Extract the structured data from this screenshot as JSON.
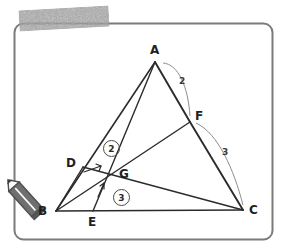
{
  "figure": {
    "kind": "geometry-diagram",
    "frame": {
      "stroke": "#7b7b7b",
      "corner_radius": 9
    },
    "ink_color": "#2b2b2b",
    "light_ink_color": "#8d8d8d"
  },
  "vertices": [
    {
      "id": "A",
      "label": "A",
      "x": 155,
      "y": 62,
      "label_x": 150,
      "label_y": 44
    },
    {
      "id": "B",
      "label": "B",
      "x": 56,
      "y": 211,
      "label_x": 38,
      "label_y": 205
    },
    {
      "id": "C",
      "label": "C",
      "x": 243,
      "y": 210,
      "label_x": 249,
      "label_y": 204
    },
    {
      "id": "D",
      "label": "D",
      "x": 83,
      "y": 167,
      "label_x": 66,
      "label_y": 157
    },
    {
      "id": "E",
      "label": "E",
      "x": 93,
      "y": 211,
      "label_x": 88,
      "label_y": 216
    },
    {
      "id": "F",
      "label": "F",
      "x": 190,
      "y": 122,
      "label_x": 195,
      "label_y": 110
    },
    {
      "id": "G",
      "label": "G",
      "x": 110,
      "y": 175,
      "label_x": 119,
      "label_y": 168
    }
  ],
  "segments": [
    {
      "name": "side-AB",
      "from": "A",
      "to": "B",
      "weight": 1.6,
      "shade": "dark"
    },
    {
      "name": "side-BC",
      "from": "B",
      "to": "C",
      "weight": 1.6,
      "shade": "dark"
    },
    {
      "name": "side-AC-upper",
      "from": "A",
      "to": "F",
      "weight": 1.9,
      "shade": "dark"
    },
    {
      "name": "side-FC-lower",
      "from": "F",
      "to": "C",
      "weight": 1.9,
      "shade": "dark"
    },
    {
      "name": "cevian-A-to-E",
      "from": "A",
      "to": "E",
      "weight": 1.4,
      "shade": "dark"
    },
    {
      "name": "cevian-B-to-F",
      "from": "B",
      "to": "F",
      "weight": 1.4,
      "shade": "dark"
    },
    {
      "name": "cevian-D-to-C",
      "from": "D",
      "to": "C",
      "weight": 1.4,
      "shade": "dark"
    },
    {
      "name": "segment-B-to-D",
      "from": "B",
      "to": "D",
      "weight": 1.4,
      "shade": "dark"
    }
  ],
  "measure_arcs": [
    {
      "name": "arc-AF-length",
      "label": "2",
      "label_x": 179,
      "label_y": 77,
      "path": "M 163,63 C 178,64 188,86 190,116"
    },
    {
      "name": "arc-FC-length",
      "label": "3",
      "label_x": 222,
      "label_y": 148,
      "path": "M 196,123 C 218,133 234,170 243,205"
    }
  ],
  "ratio_marks": [
    {
      "name": "ratio-mark-2",
      "label": "2",
      "x": 103,
      "y": 140
    },
    {
      "name": "ratio-mark-3",
      "label": "3",
      "x": 113,
      "y": 189
    }
  ],
  "tick_arrows": [
    {
      "name": "tick-arrow-on-DG",
      "path": "M 84,172 L 101,166",
      "head": "M 101,166 L 96,164 M 101,166 L 99,171"
    },
    {
      "name": "tick-arrow-on-EG",
      "path": "M 98,197 L 104,183",
      "head": "M 104,183 L 100,186 M 104,183 L 104,189"
    }
  ],
  "annotations": {
    "highlight_smudge": {
      "name": "highlighter-smudge",
      "color": "#9a9a9a"
    },
    "pencil_cursor": {
      "name": "pencil-cursor",
      "body_color": "#6d6d6d",
      "tip_color": "#ffffff"
    }
  }
}
